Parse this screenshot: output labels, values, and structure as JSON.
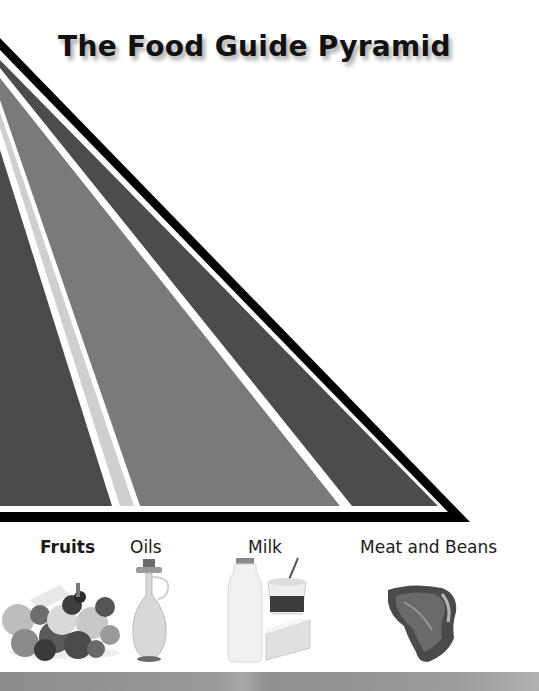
{
  "title": "The Food Guide Pyramid",
  "pyramid": {
    "colors": {
      "outline": "#000000",
      "divider": "#ffffff",
      "band_dark": "#4a4a4a",
      "band_oils": "#cfcfcf",
      "band_milk": "#7a7a7a",
      "band_meat": "#4c4c4c"
    }
  },
  "food_groups": [
    {
      "label": "Fruits",
      "image": "fruit-basket"
    },
    {
      "label": "Oils",
      "image": "oil-cruet"
    },
    {
      "label": "Milk",
      "image": "milk-bottle-yogurt-cheese"
    },
    {
      "label": "Meat and Beans",
      "image": "steak"
    }
  ]
}
